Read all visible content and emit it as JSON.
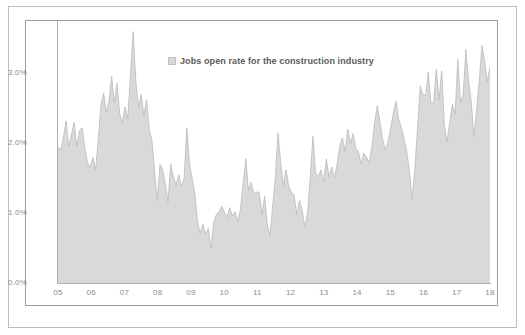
{
  "chart_data": {
    "type": "area",
    "title": "",
    "subtitle": "",
    "xlabel": "",
    "ylabel": "",
    "ylim": [
      0.0,
      3.75
    ],
    "xlim": [
      "05",
      "18"
    ],
    "grid": false,
    "legend": {
      "position": "top-center-inside",
      "entries": [
        {
          "name": "Jobs open rate for the construction industry",
          "color": "#d9d9d9"
        }
      ]
    },
    "ytick_labels": [
      "0.0%",
      "1.0%",
      "2.0%",
      "3.0%"
    ],
    "ytick_values": [
      0.0,
      1.0,
      2.0,
      3.0
    ],
    "xtick_labels": [
      "05",
      "06",
      "07",
      "08",
      "09",
      "10",
      "11",
      "12",
      "13",
      "14",
      "15",
      "16",
      "17",
      "18"
    ],
    "xtick_values": [
      2005,
      2006,
      2007,
      2008,
      2009,
      2010,
      2011,
      2012,
      2013,
      2014,
      2015,
      2016,
      2017,
      2018
    ],
    "series": [
      {
        "name": "Jobs open rate for the construction industry",
        "color": "#d9d9d9",
        "line_color": "#b5b5b5",
        "units": "percent",
        "frequency": "monthly",
        "x_start": "2005-01",
        "values": [
          1.95,
          1.9,
          2.08,
          2.32,
          1.96,
          2.12,
          2.3,
          1.96,
          2.18,
          2.22,
          1.94,
          1.72,
          1.65,
          1.8,
          1.62,
          2.05,
          2.55,
          2.72,
          2.45,
          2.6,
          2.96,
          2.58,
          2.86,
          2.42,
          2.3,
          2.52,
          2.35,
          2.98,
          3.6,
          2.9,
          2.52,
          2.7,
          2.4,
          2.62,
          2.2,
          2.05,
          1.6,
          1.18,
          1.7,
          1.62,
          1.42,
          1.16,
          1.7,
          1.52,
          1.4,
          1.55,
          1.38,
          1.5,
          2.22,
          1.72,
          1.5,
          1.28,
          0.88,
          0.72,
          0.84,
          0.7,
          0.78,
          0.5,
          0.86,
          0.98,
          1.02,
          1.1,
          1.02,
          0.94,
          1.08,
          0.96,
          1.02,
          0.88,
          1.06,
          1.42,
          1.78,
          1.32,
          1.44,
          1.28,
          1.3,
          1.3,
          0.98,
          1.24,
          0.84,
          0.68,
          1.1,
          1.52,
          2.15,
          1.72,
          1.4,
          1.62,
          1.38,
          1.3,
          1.26,
          0.98,
          1.18,
          1.04,
          0.8,
          1.0,
          1.52,
          2.1,
          1.58,
          1.52,
          1.62,
          1.45,
          1.78,
          1.52,
          1.66,
          1.5,
          1.7,
          1.96,
          2.08,
          1.88,
          2.2,
          2.0,
          2.14,
          1.92,
          1.88,
          1.7,
          1.86,
          1.8,
          1.72,
          1.96,
          2.3,
          2.54,
          2.3,
          2.06,
          1.9,
          2.02,
          2.22,
          2.44,
          2.6,
          2.34,
          2.22,
          2.06,
          1.88,
          1.6,
          1.2,
          1.64,
          2.22,
          2.82,
          2.7,
          2.68,
          3.02,
          2.56,
          2.6,
          3.06,
          2.62,
          3.04,
          2.26,
          2.02,
          2.3,
          2.56,
          2.42,
          3.2,
          2.58,
          2.7,
          3.34,
          2.9,
          2.6,
          2.1,
          2.48,
          2.9,
          3.4,
          3.18,
          2.88,
          3.1
        ]
      }
    ],
    "summary": {
      "max_value": 3.6,
      "max_period": "2007",
      "min_value": 0.5,
      "min_period": "2009",
      "range_note": "Monthly construction job openings rate, 2005 through 2018"
    }
  }
}
